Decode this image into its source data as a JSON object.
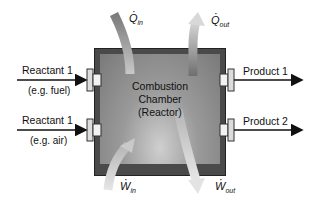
{
  "diagram": {
    "chamber": {
      "line1": "Combustion",
      "line2": "Chamber",
      "line3": "(Reactor)"
    },
    "inputs": [
      {
        "name": "Reactant 1",
        "note": "(e.g. fuel)"
      },
      {
        "name": "Reactant 1",
        "note": "(e.g. air)"
      }
    ],
    "outputs": [
      {
        "name": "Product 1"
      },
      {
        "name": "Product 2"
      }
    ],
    "energy_flows": {
      "heat_in": {
        "symbol": "Q",
        "sub": "in"
      },
      "heat_out": {
        "symbol": "Q",
        "sub": "out"
      },
      "work_in": {
        "symbol": "W",
        "sub": "in"
      },
      "work_out": {
        "symbol": "W",
        "sub": "out"
      }
    },
    "colors": {
      "wall": "#4a4a4a",
      "interior": "#8a8a8a",
      "arrow": "#111111",
      "flow_arrow": "#9a9a9a"
    }
  }
}
